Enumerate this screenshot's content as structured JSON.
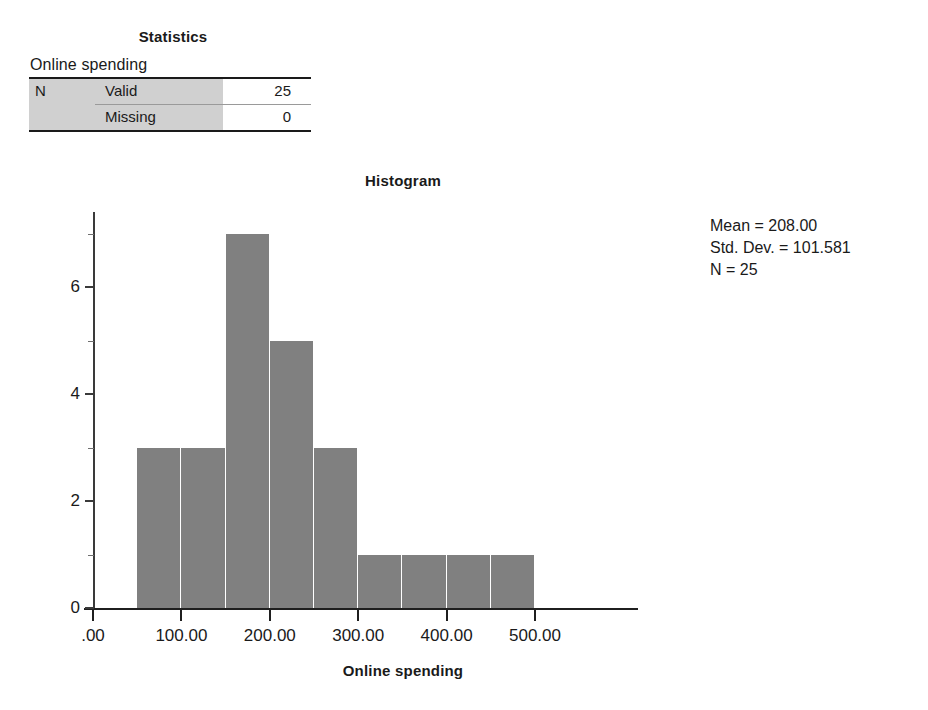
{
  "stats_table": {
    "title": "Statistics",
    "variable_label": "Online spending",
    "rows": [
      {
        "group": "N",
        "label": "Valid",
        "value": "25"
      },
      {
        "group": "",
        "label": "Missing",
        "value": "0"
      }
    ]
  },
  "chart": {
    "title": "Histogram",
    "xlabel": "Online spending",
    "ylabel": "Frequency",
    "annotation": {
      "mean": "Mean = 208.00",
      "std_dev": "Std. Dev. = 101.581",
      "n": "N = 25"
    },
    "bar_color": "#808080",
    "axis_color": "#1f1f1f"
  },
  "chart_data": {
    "type": "bar",
    "subtype": "histogram",
    "title": "Histogram",
    "xlabel": "Online spending",
    "ylabel": "Frequency",
    "xlim": [
      0,
      550
    ],
    "ylim": [
      0,
      7.4
    ],
    "grid": false,
    "legend": null,
    "bin_width": 50,
    "bin_edges": [
      50,
      100,
      150,
      200,
      250,
      300,
      350,
      400,
      450,
      500
    ],
    "bin_centers": [
      75,
      125,
      175,
      225,
      275,
      325,
      375,
      425,
      475
    ],
    "values": [
      3,
      3,
      7,
      5,
      3,
      1,
      1,
      1,
      1
    ],
    "categories": [
      "50-100",
      "100-150",
      "150-200",
      "200-250",
      "250-300",
      "300-350",
      "350-400",
      "400-450",
      "450-500"
    ],
    "xticks": [
      0,
      100,
      200,
      300,
      400,
      500
    ],
    "xticklabels": [
      ".00",
      "100.00",
      "200.00",
      "300.00",
      "400.00",
      "500.00"
    ],
    "yticks": [
      0,
      2,
      4,
      6
    ],
    "yticklabels": [
      "0",
      "2",
      "4",
      "6"
    ],
    "yminorticks": [
      1,
      3,
      5,
      7
    ],
    "annotations": [
      "Mean = 208.00",
      "Std. Dev. = 101.581",
      "N = 25"
    ],
    "statistics": {
      "mean": 208.0,
      "std_dev": 101.581,
      "n": 25
    }
  }
}
